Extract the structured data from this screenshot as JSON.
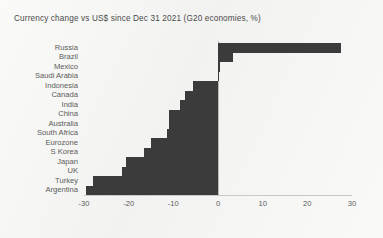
{
  "chart_data": {
    "type": "bar",
    "orientation": "horizontal",
    "title": "Currency change vs US$ since Dec 31 2021 (G20 economies, %)",
    "xlabel": "",
    "ylabel": "",
    "xlim": [
      -30,
      30
    ],
    "xticks": [
      -30,
      -20,
      -10,
      0,
      10,
      20,
      30
    ],
    "xtick_labels": [
      "-30",
      "-20",
      "-10",
      "0",
      "10",
      "20",
      "30"
    ],
    "grid": false,
    "legend": null,
    "bar_color": "#3b3b3b",
    "background_color": "#f4f4f2",
    "text_color": "#5b5b5b",
    "categories": [
      "Russia",
      "Brazil",
      "Mexico",
      "Saudi Arabia",
      "Indonesia",
      "Canada",
      "India",
      "China",
      "Australia",
      "South Africa",
      "Eurozone",
      "S Korea",
      "Japan",
      "UK",
      "Turkey",
      "Argentina"
    ],
    "values": [
      27.5,
      3.3,
      0.5,
      0.0,
      -5.5,
      -7.5,
      -8.5,
      -11.0,
      -11.0,
      -11.5,
      -15.0,
      -16.5,
      -20.5,
      -21.5,
      -28.0,
      -29.5
    ]
  }
}
